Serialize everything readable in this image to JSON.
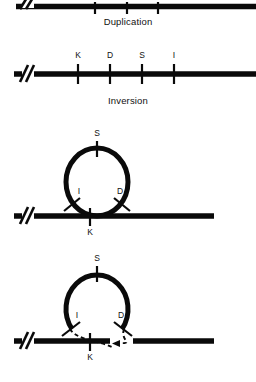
{
  "figure": {
    "type": "genetics-recombination-diagram",
    "background_color": "#ffffff",
    "ink_color": "#0a0a0a",
    "width": 256,
    "height": 382
  },
  "captions": {
    "duplication": "Duplication",
    "inversion": "Inversion"
  },
  "panels": [
    {
      "id": "panel-top-chromosome",
      "name": "duplicated-chromosome-line",
      "description": "horizontal chromosome line with break mark and three tick marks, partially cropped at top edge",
      "line": {
        "x1": 18,
        "x2": 256,
        "y": 6,
        "thickness": 5
      },
      "break_mark": {
        "x": 26
      },
      "ticks": [
        {
          "x": 95,
          "label": ""
        },
        {
          "x": 127,
          "label": ""
        },
        {
          "x": 158,
          "label": ""
        }
      ]
    },
    {
      "id": "panel-inversion-chromosome",
      "name": "inverted-chromosome-line",
      "description": "horizontal chromosome line with break mark and four labelled loci",
      "line": {
        "x1": 18,
        "x2": 256,
        "y": 74,
        "thickness": 5
      },
      "break_mark": {
        "x": 26
      },
      "ticks": [
        {
          "x": 78,
          "label": "K"
        },
        {
          "x": 110,
          "label": "D"
        },
        {
          "x": 142,
          "label": "S"
        },
        {
          "x": 174,
          "label": "I"
        }
      ]
    },
    {
      "id": "panel-loop-closed",
      "name": "inversion-loop-paired",
      "description": "chromosome line with closed inversion loop; loci S at loop apex, I left, D right, K on the line",
      "line": {
        "x1": 18,
        "x2": 214,
        "y": 216,
        "thickness": 5
      },
      "break_mark": {
        "x": 26
      },
      "loop": {
        "cx": 97,
        "cy": 182,
        "rx": 31,
        "ry": 34,
        "stroke": 5
      },
      "loci": [
        {
          "label": "S",
          "position": "apex",
          "angle": 90
        },
        {
          "label": "I",
          "position": "lower-left",
          "angle": 210
        },
        {
          "label": "D",
          "position": "lower-right",
          "angle": 330
        },
        {
          "label": "K",
          "position": "on-line",
          "x": 90
        }
      ]
    },
    {
      "id": "panel-loop-crossover",
      "name": "inversion-loop-crossover",
      "description": "inversion loop with crossover: loop arc open at base, dashed strands rejoin broken chromosome line with a gap",
      "line_left": {
        "x1": 18,
        "x2": 110,
        "y": 341,
        "thickness": 5
      },
      "line_right": {
        "x1": 133,
        "x2": 214,
        "y": 341,
        "thickness": 5
      },
      "break_mark": {
        "x": 26
      },
      "loop": {
        "cx": 97,
        "cy": 307,
        "rx": 31,
        "ry": 34,
        "stroke": 5,
        "open_base": true
      },
      "dashed_strands": 2,
      "loci": [
        {
          "label": "S",
          "position": "apex",
          "angle": 90
        },
        {
          "label": "I",
          "position": "lower-left",
          "angle": 210
        },
        {
          "label": "D",
          "position": "lower-right",
          "angle": 330
        },
        {
          "label": "K",
          "position": "on-line",
          "x": 90
        }
      ]
    }
  ],
  "labels": {
    "S": "S",
    "I": "I",
    "D": "D",
    "K": "K"
  }
}
